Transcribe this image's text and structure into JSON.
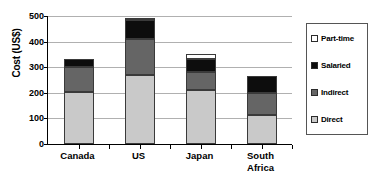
{
  "chart_data": {
    "type": "bar",
    "subtype": "stacked-bar",
    "title": "",
    "xlabel": "",
    "ylabel": "Cost (US$)",
    "ylim": [
      0,
      500
    ],
    "yticks": [
      0,
      100,
      200,
      300,
      400,
      500
    ],
    "ytick_labels": [
      "0",
      "100",
      "200",
      "300",
      "400",
      "500"
    ],
    "grid": true,
    "legend_position": "right",
    "categories": [
      "Canada",
      "US",
      "Japan",
      "South Africa"
    ],
    "category_label_lines": [
      [
        "Canada"
      ],
      [
        "US"
      ],
      [
        "Japan"
      ],
      [
        "South",
        "Africa"
      ]
    ],
    "series": [
      {
        "name": "Direct",
        "color": "#c9c9c9",
        "values": [
          205,
          268,
          210,
          115
        ]
      },
      {
        "name": "Indirect",
        "color": "#656565",
        "values": [
          95,
          142,
          72,
          83
        ]
      },
      {
        "name": "Salaried",
        "color": "#0d0d0d",
        "values": [
          32,
          75,
          50,
          67
        ]
      },
      {
        "name": "Part-time",
        "color": "#ffffff",
        "values": [
          0,
          5,
          19,
          0
        ]
      }
    ],
    "totals": [
      332,
      490,
      351,
      265
    ],
    "legend_entries": [
      {
        "label": "Part-time",
        "color": "#ffffff"
      },
      {
        "label": "Salaried",
        "color": "#0d0d0d"
      },
      {
        "label": "Indirect",
        "color": "#656565"
      },
      {
        "label": "Direct",
        "color": "#c9c9c9"
      }
    ]
  }
}
